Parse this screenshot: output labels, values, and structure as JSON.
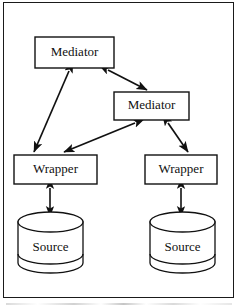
{
  "figure": {
    "type": "architecture-diagram",
    "frame": {
      "border_color": "#1a1a1a",
      "background": "#ffffff"
    },
    "stroke_color": "#111111",
    "fill_color": "#ffffff"
  },
  "nodes": [
    {
      "id": "mediator-top",
      "label": "Mediator",
      "shape": "rectangle",
      "x": 35,
      "y": 37,
      "w": 79,
      "h": 31
    },
    {
      "id": "mediator-middle",
      "label": "Mediator",
      "shape": "rectangle",
      "x": 114,
      "y": 92,
      "w": 75,
      "h": 28
    },
    {
      "id": "wrapper-left",
      "label": "Wrapper",
      "shape": "rectangle",
      "x": 14,
      "y": 155,
      "w": 83,
      "h": 29
    },
    {
      "id": "wrapper-right",
      "label": "Wrapper",
      "shape": "rectangle",
      "x": 145,
      "y": 155,
      "w": 72,
      "h": 29
    },
    {
      "id": "source-left",
      "label": "Source",
      "shape": "cylinder",
      "x": 18,
      "y": 212,
      "w": 65,
      "h": 61
    },
    {
      "id": "source-right",
      "label": "Source",
      "shape": "cylinder",
      "x": 150,
      "y": 212,
      "w": 65,
      "h": 61
    }
  ],
  "edges": [
    {
      "id": "edge-mediator-top-mediator-middle",
      "from": "mediator-top",
      "to": "mediator-middle",
      "arrow": "double"
    },
    {
      "id": "edge-mediator-top-wrapper-left",
      "from": "mediator-top",
      "to": "wrapper-left",
      "arrow": "double"
    },
    {
      "id": "edge-mediator-middle-wrapper-left",
      "from": "mediator-middle",
      "to": "wrapper-left",
      "arrow": "double"
    },
    {
      "id": "edge-mediator-middle-wrapper-right",
      "from": "mediator-middle",
      "to": "wrapper-right",
      "arrow": "double"
    },
    {
      "id": "edge-wrapper-left-source-left",
      "from": "wrapper-left",
      "to": "source-left",
      "arrow": "double"
    },
    {
      "id": "edge-wrapper-right-source-right",
      "from": "wrapper-right",
      "to": "source-right",
      "arrow": "double"
    }
  ]
}
